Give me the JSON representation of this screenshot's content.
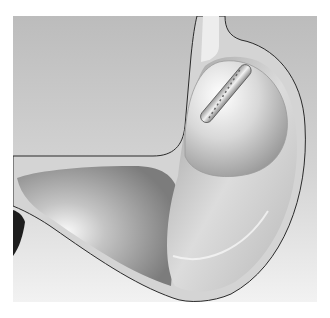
{
  "figure": {
    "colors": {
      "background_top": "#bdbdbd",
      "background_bottom": "#f0f0f0",
      "wall": "#d6d6d6",
      "outline": "#2a2a2a",
      "lumen_light": "#f4f4f4",
      "lumen_dark": "#8a8a8a"
    }
  }
}
